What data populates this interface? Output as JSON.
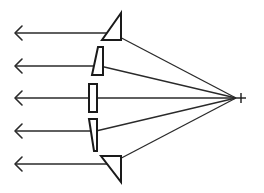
{
  "diagram": {
    "title": "",
    "stroke_color": "#1a1a1a",
    "background": "#ffffff",
    "source": {
      "x": 240,
      "y": 98,
      "symbol": "+"
    },
    "rays": [
      {
        "id": "ray-1",
        "y": 33,
        "prism_x": 112,
        "arrow_x": 15
      },
      {
        "id": "ray-2",
        "y": 66,
        "prism_x": 100,
        "arrow_x": 15
      },
      {
        "id": "ray-3",
        "y": 98,
        "prism_x": 93,
        "arrow_x": 15
      },
      {
        "id": "ray-4",
        "y": 131,
        "prism_x": 96,
        "arrow_x": 15
      },
      {
        "id": "ray-5",
        "y": 164,
        "prism_x": 110,
        "arrow_x": 15
      }
    ],
    "prisms": [
      {
        "id": "prism-1",
        "shape": "triangle",
        "points": "121,13 102,40 121,40"
      },
      {
        "id": "prism-2",
        "shape": "wedge",
        "points": "98,47 103,47 103,75 92,75"
      },
      {
        "id": "prism-3",
        "shape": "rectangle",
        "points": "89,84 97,84 97,112 89,112"
      },
      {
        "id": "prism-4",
        "shape": "wedge",
        "points": "89,119 97,119 97,151 94,151"
      },
      {
        "id": "prism-5",
        "shape": "triangle",
        "points": "101,156 121,156 121,182"
      }
    ],
    "labels": []
  }
}
